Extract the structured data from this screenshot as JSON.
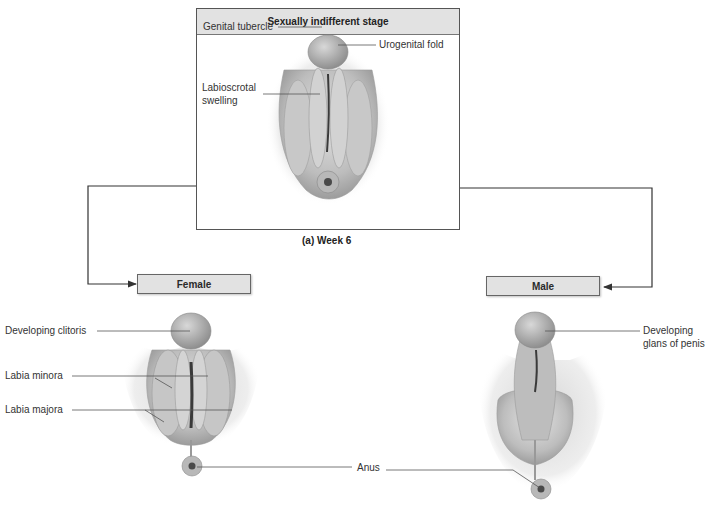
{
  "top_panel": {
    "title": "Sexually indifferent stage",
    "labels": {
      "genital_tubercle": "Genital tubercle",
      "urogenital_fold": "Urogenital fold",
      "labioscrotal_swelling_line1": "Labioscrotal",
      "labioscrotal_swelling_line2": "swelling"
    },
    "caption": "(a) Week 6"
  },
  "female": {
    "box_label": "Female",
    "labels": {
      "developing_clitoris": "Developing clitoris",
      "labia_minora": "Labia minora",
      "labia_majora": "Labia majora"
    }
  },
  "male": {
    "box_label": "Male",
    "labels": {
      "glans_line1": "Developing",
      "glans_line2": "glans of penis"
    }
  },
  "shared": {
    "anus": "Anus"
  },
  "colors": {
    "header_fill": "#e2e2e2",
    "tissue_light": "#d6d6d6",
    "tissue_dark": "#8a8a8a",
    "line": "#333333"
  }
}
